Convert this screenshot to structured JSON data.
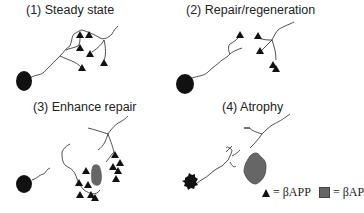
{
  "panels": [
    {
      "id": 1,
      "title": "(1) Steady state"
    },
    {
      "id": 2,
      "title": "(2) Repair/regeneration"
    },
    {
      "id": 3,
      "title": "(3) Enhance repair"
    },
    {
      "id": 4,
      "title": "(4) Atrophy"
    }
  ],
  "legend": {
    "triangle_label": "= βAPP",
    "square_label": "= βAP"
  },
  "colors": {
    "ink": "#111111",
    "plaque": "#666666"
  }
}
